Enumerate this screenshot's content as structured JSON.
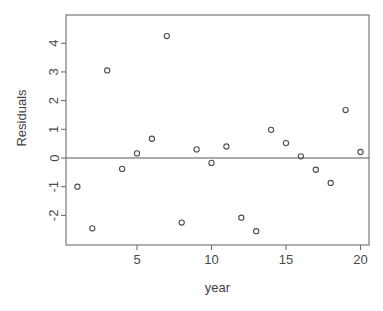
{
  "chart_data": {
    "type": "scatter",
    "title": "",
    "xlabel": "year",
    "ylabel": "Residuals",
    "xlim": [
      0.3,
      20.7
    ],
    "ylim": [
      -2.85,
      4.6
    ],
    "grid": false,
    "legend": null,
    "reference_line_y": 0,
    "x_ticks": [
      5,
      10,
      15,
      20
    ],
    "y_ticks": [
      -2,
      -1,
      0,
      1,
      2,
      3,
      4
    ],
    "x_tick_labels": [
      "5",
      "10",
      "15",
      "20"
    ],
    "y_tick_labels": [
      "-2",
      "-1",
      "0",
      "1",
      "2",
      "3",
      "4"
    ],
    "x": [
      1,
      2,
      3,
      4,
      5,
      6,
      7,
      8,
      9,
      10,
      11,
      12,
      13,
      14,
      15,
      16,
      17,
      18,
      19,
      20
    ],
    "y": [
      -1.0,
      -2.45,
      3.05,
      -0.38,
      0.16,
      0.67,
      4.25,
      -2.25,
      0.3,
      -0.17,
      0.4,
      -2.08,
      -2.55,
      0.98,
      0.52,
      0.06,
      -0.41,
      -0.87,
      1.67,
      0.21
    ],
    "points": [
      {
        "x": 1,
        "y": -1.0
      },
      {
        "x": 2,
        "y": -2.45
      },
      {
        "x": 3,
        "y": 3.05
      },
      {
        "x": 4,
        "y": -0.38
      },
      {
        "x": 5,
        "y": 0.16
      },
      {
        "x": 6,
        "y": 0.67
      },
      {
        "x": 7,
        "y": 4.25
      },
      {
        "x": 8,
        "y": -2.25
      },
      {
        "x": 9,
        "y": 0.3
      },
      {
        "x": 10,
        "y": -0.17
      },
      {
        "x": 11,
        "y": 0.4
      },
      {
        "x": 12,
        "y": -2.08
      },
      {
        "x": 13,
        "y": -2.55
      },
      {
        "x": 14,
        "y": 0.98
      },
      {
        "x": 15,
        "y": 0.52
      },
      {
        "x": 16,
        "y": 0.06
      },
      {
        "x": 17,
        "y": -0.41
      },
      {
        "x": 18,
        "y": -0.87
      },
      {
        "x": 19,
        "y": 1.67
      },
      {
        "x": 20,
        "y": 0.21
      }
    ],
    "marker": {
      "shape": "open-circle",
      "radius": 2.6,
      "color": "#4d4d4d"
    }
  },
  "plot_geometry": {
    "frame_left": 66,
    "frame_right": 369,
    "frame_top": 15,
    "frame_bottom": 245,
    "x_scale_px_per_unit": 14.9,
    "x_origin_px": 62.5,
    "y_zero_px": 158,
    "y_scale_px_per_unit": 28.7
  }
}
